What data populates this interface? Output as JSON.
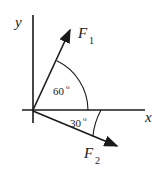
{
  "figure": {
    "kind": "force-vector-diagram",
    "width": 158,
    "height": 172,
    "background_color": "#ffffff",
    "stroke_color": "#1a1a1a",
    "text_color": "#1a1a1a"
  },
  "axes": {
    "x_axis": {
      "label": "x",
      "label_x": 145,
      "label_y": 122,
      "line": {
        "x1": 22,
        "y1": 110,
        "x2": 145,
        "y2": 110
      }
    },
    "y_axis": {
      "label": "y",
      "label_x": 15,
      "label_y": 27,
      "line": {
        "x1": 33,
        "y1": 15,
        "x2": 33,
        "y2": 123
      }
    },
    "origin": {
      "x": 33,
      "y": 110
    }
  },
  "vectors": [
    {
      "name": "F1",
      "label_base": "F",
      "label_sub": "1",
      "label_x": 78,
      "label_y": 38,
      "sub_x": 89,
      "sub_y": 44,
      "tip_x": 72,
      "tip_y": 27,
      "angle_from_positive_x_deg": 60,
      "direction": "up-right"
    },
    {
      "name": "F2",
      "label_base": "F",
      "label_sub": "2",
      "label_x": 84,
      "label_y": 158,
      "sub_x": 95,
      "sub_y": 164,
      "tip_x": 120,
      "tip_y": 148,
      "angle_from_positive_x_deg": -30,
      "direction": "down-right"
    }
  ],
  "angles": [
    {
      "name": "angle-f1-from-x-axis",
      "value": "60",
      "degree_symbol": "o",
      "label_x": 53,
      "label_y": 95,
      "deg_x": 69,
      "deg_y": 90,
      "arc_radius": 55,
      "between": [
        "x-axis",
        "F1"
      ]
    },
    {
      "name": "angle-f2-from-x-axis",
      "value": "30",
      "degree_symbol": "o",
      "label_x": 70,
      "label_y": 127,
      "deg_x": 86,
      "deg_y": 122,
      "arc_radius": 68,
      "between": [
        "x-axis",
        "F2"
      ]
    }
  ]
}
